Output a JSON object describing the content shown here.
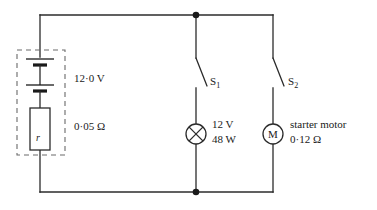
{
  "diagram": {
    "stroke_color": "#2b2b2b",
    "dashed_color": "#6a6a6a",
    "background": "#ffffff",
    "battery": {
      "emf_label": "12·0 V",
      "internal_resistance_label": "0·05 Ω",
      "internal_resistance_symbol": "r",
      "cell_count": 2,
      "enclosure": "dashed-box"
    },
    "branches": [
      {
        "id": "lamp-branch",
        "switch_label": "S",
        "switch_subscript": "1",
        "switch_state": "open",
        "component": "lamp",
        "component_icon": "lamp-cross-circle-icon",
        "spec_line_1": "12 V",
        "spec_line_2": "48 W"
      },
      {
        "id": "motor-branch",
        "switch_label": "S",
        "switch_subscript": "2",
        "switch_state": "open",
        "component": "motor",
        "component_icon": "motor-circle-icon",
        "component_letter": "M",
        "spec_line_1": "starter motor",
        "spec_line_2": "0·12 Ω"
      }
    ],
    "junctions": [
      {
        "name": "top-junction",
        "x": 196,
        "y": 15
      },
      {
        "name": "bottom-junction",
        "x": 196,
        "y": 192
      }
    ]
  }
}
